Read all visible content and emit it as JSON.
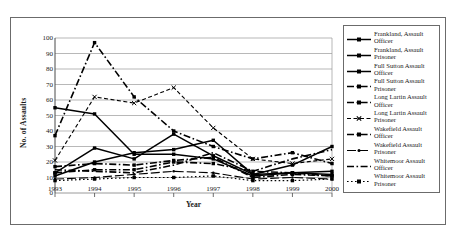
{
  "chart_data": {
    "type": "line",
    "title": "",
    "xlabel": "Year",
    "ylabel": "No. of Assaults",
    "categories": [
      "1993",
      "1994",
      "1995",
      "1996",
      "1997",
      "1998",
      "1999",
      "2000"
    ],
    "ylim": [
      0,
      100
    ],
    "ytick_step": 10,
    "yticks": [
      "0",
      "10",
      "20",
      "30",
      "40",
      "50",
      "60",
      "70",
      "80",
      "90",
      "100"
    ],
    "grid": "horizontal",
    "legend_position": "right",
    "series": [
      {
        "name": "Frankland, Assault Officer",
        "style": "solid",
        "marker": "square",
        "values": [
          55,
          51,
          25,
          25,
          22,
          11,
          13,
          12
        ]
      },
      {
        "name": "Frankland, Assault Prisoner",
        "style": "solid",
        "marker": "square",
        "values": [
          13,
          29,
          22,
          38,
          24,
          12,
          18,
          30
        ]
      },
      {
        "name": "Full Sutton Assault Officer",
        "style": "solid",
        "marker": "square",
        "values": [
          11,
          20,
          26,
          28,
          34,
          12,
          13,
          14
        ]
      },
      {
        "name": "Full Sutton Assault Prisoner",
        "style": "dashdot",
        "marker": "square",
        "values": [
          37,
          97,
          62,
          40,
          30,
          22,
          26,
          19
        ]
      },
      {
        "name": "Long Lartin Assault Officer",
        "style": "dashdot",
        "marker": "square",
        "values": [
          17,
          19,
          18,
          21,
          23,
          10,
          12,
          11
        ]
      },
      {
        "name": "Long Lartin Assault Prisoner",
        "style": "dashed-fine",
        "marker": "cross",
        "values": [
          21,
          62,
          58,
          68,
          42,
          22,
          19,
          22
        ]
      },
      {
        "name": "Wakefield Assault Officer",
        "style": "dashdot",
        "marker": "square",
        "values": [
          13,
          15,
          15,
          20,
          19,
          14,
          13,
          11
        ]
      },
      {
        "name": "Wakefield Assault Prisoner",
        "style": "longdash",
        "marker": "dot",
        "values": [
          9,
          10,
          12,
          14,
          13,
          9,
          10,
          9
        ]
      },
      {
        "name": "Whitemoor Assault Officer",
        "style": "dashdot",
        "marker": "none",
        "values": [
          15,
          14,
          13,
          18,
          26,
          14,
          22,
          28
        ]
      },
      {
        "name": "Whitemoor Assault Prisoner",
        "style": "dotted",
        "marker": "square",
        "values": [
          8,
          9,
          10,
          10,
          11,
          8,
          8,
          9
        ]
      }
    ]
  }
}
